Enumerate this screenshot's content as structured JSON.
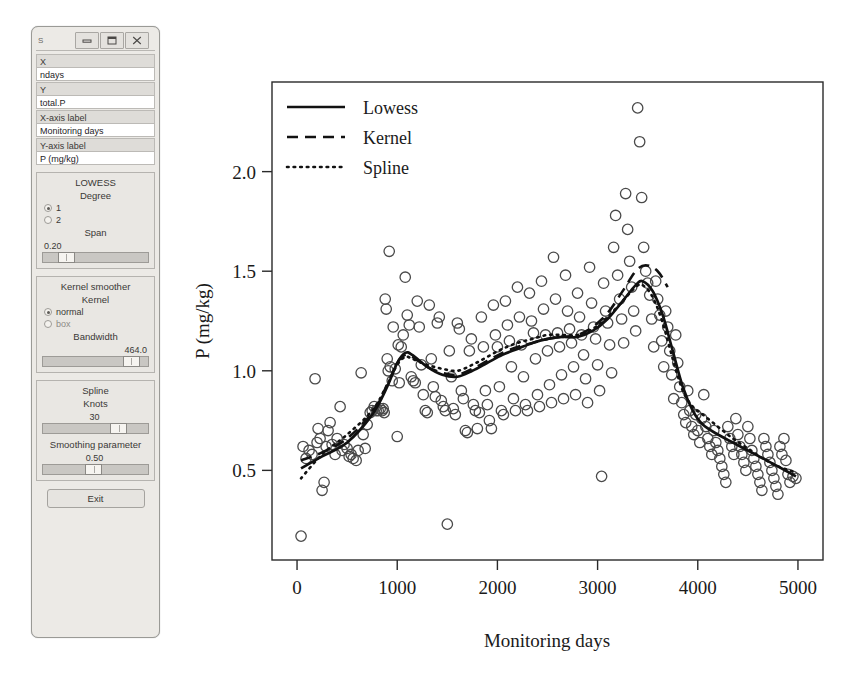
{
  "window": {
    "title": "S",
    "buttons": {
      "minimize": "minimize-icon",
      "maximize": "maximize-icon",
      "close": "close-icon"
    }
  },
  "form": {
    "fields": [
      {
        "label": "X",
        "value": "ndays"
      },
      {
        "label": "Y",
        "value": "total.P"
      },
      {
        "label": "X-axis label",
        "value": "Monitoring days"
      },
      {
        "label": "Y-axis label",
        "value": "P (mg/kg)"
      }
    ]
  },
  "lowess": {
    "title": "LOWESS",
    "degree_label": "Degree",
    "degree_options": [
      {
        "label": "1",
        "selected": true
      },
      {
        "label": "2",
        "selected": false
      }
    ],
    "span_label": "Span",
    "span_value": "0.20",
    "span_pct": 18
  },
  "kernel": {
    "title": "Kernel smoother",
    "kernel_label": "Kernel",
    "kernel_options": [
      {
        "label": "normal",
        "selected": true
      },
      {
        "label": "box",
        "selected": false
      }
    ],
    "bandwidth_label": "Bandwidth",
    "bandwidth_value": "464.0",
    "bandwidth_pct": 84
  },
  "spline": {
    "title": "Spline",
    "knots_label": "Knots",
    "knots_value": "30",
    "knots_pct": 72,
    "smoothing_label": "Smoothing parameter",
    "smoothing_value": "0.50",
    "smoothing_pct": 47
  },
  "exit_button": "Exit",
  "chart_data": {
    "type": "scatter",
    "title": "",
    "xlabel": "Monitoring days",
    "ylabel": "P (mg/kg)",
    "xlim": [
      -250,
      5250
    ],
    "ylim": [
      0.05,
      2.45
    ],
    "xticks": [
      0,
      1000,
      2000,
      3000,
      4000,
      5000
    ],
    "yticks": [
      0.5,
      1.0,
      1.5,
      2.0
    ],
    "grid": false,
    "legend_position": "top-left",
    "legend": [
      {
        "name": "Lowess",
        "style": "solid"
      },
      {
        "name": "Kernel",
        "style": "dashed"
      },
      {
        "name": "Spline",
        "style": "dotted"
      }
    ],
    "marker": "open-circle",
    "points": [
      [
        40,
        0.17
      ],
      [
        60,
        0.62
      ],
      [
        90,
        0.56
      ],
      [
        120,
        0.6
      ],
      [
        150,
        0.58
      ],
      [
        180,
        0.96
      ],
      [
        200,
        0.64
      ],
      [
        210,
        0.71
      ],
      [
        230,
        0.66
      ],
      [
        250,
        0.4
      ],
      [
        270,
        0.44
      ],
      [
        290,
        0.62
      ],
      [
        310,
        0.7
      ],
      [
        330,
        0.74
      ],
      [
        350,
        0.63
      ],
      [
        380,
        0.58
      ],
      [
        400,
        0.66
      ],
      [
        430,
        0.82
      ],
      [
        450,
        0.6
      ],
      [
        470,
        0.63
      ],
      [
        500,
        0.61
      ],
      [
        520,
        0.57
      ],
      [
        540,
        0.58
      ],
      [
        560,
        0.56
      ],
      [
        590,
        0.55
      ],
      [
        610,
        0.6
      ],
      [
        640,
        0.99
      ],
      [
        660,
        0.68
      ],
      [
        680,
        0.61
      ],
      [
        700,
        0.73
      ],
      [
        730,
        0.79
      ],
      [
        750,
        0.8
      ],
      [
        770,
        0.82
      ],
      [
        790,
        0.8
      ],
      [
        810,
        0.8
      ],
      [
        830,
        0.81
      ],
      [
        850,
        0.8
      ],
      [
        860,
        0.81
      ],
      [
        870,
        0.79
      ],
      [
        880,
        1.36
      ],
      [
        890,
        1.31
      ],
      [
        900,
        1.06
      ],
      [
        910,
        1.0
      ],
      [
        920,
        1.6
      ],
      [
        930,
        1.02
      ],
      [
        950,
        0.95
      ],
      [
        960,
        1.22
      ],
      [
        980,
        1.01
      ],
      [
        1000,
        0.67
      ],
      [
        1010,
        1.13
      ],
      [
        1020,
        0.94
      ],
      [
        1040,
        1.12
      ],
      [
        1060,
        1.18
      ],
      [
        1080,
        1.47
      ],
      [
        1100,
        1.28
      ],
      [
        1120,
        1.23
      ],
      [
        1140,
        0.97
      ],
      [
        1160,
        0.95
      ],
      [
        1180,
        0.94
      ],
      [
        1200,
        1.35
      ],
      [
        1220,
        1.22
      ],
      [
        1240,
        1.03
      ],
      [
        1260,
        0.88
      ],
      [
        1280,
        0.8
      ],
      [
        1300,
        0.79
      ],
      [
        1320,
        1.33
      ],
      [
        1340,
        1.06
      ],
      [
        1360,
        0.92
      ],
      [
        1380,
        0.87
      ],
      [
        1400,
        1.24
      ],
      [
        1420,
        1.27
      ],
      [
        1440,
        0.85
      ],
      [
        1460,
        0.82
      ],
      [
        1480,
        0.8
      ],
      [
        1500,
        0.23
      ],
      [
        1520,
        1.1
      ],
      [
        1540,
        0.97
      ],
      [
        1560,
        0.81
      ],
      [
        1580,
        0.78
      ],
      [
        1600,
        1.24
      ],
      [
        1620,
        1.21
      ],
      [
        1640,
        0.9
      ],
      [
        1660,
        0.86
      ],
      [
        1680,
        0.7
      ],
      [
        1700,
        0.69
      ],
      [
        1720,
        1.1
      ],
      [
        1740,
        1.16
      ],
      [
        1760,
        0.83
      ],
      [
        1780,
        0.8
      ],
      [
        1800,
        0.71
      ],
      [
        1820,
        0.79
      ],
      [
        1840,
        1.27
      ],
      [
        1860,
        1.12
      ],
      [
        1880,
        0.9
      ],
      [
        1900,
        0.83
      ],
      [
        1920,
        0.75
      ],
      [
        1940,
        0.71
      ],
      [
        1960,
        1.33
      ],
      [
        1980,
        1.18
      ],
      [
        2000,
        1.12
      ],
      [
        2020,
        0.92
      ],
      [
        2040,
        0.8
      ],
      [
        2060,
        0.78
      ],
      [
        2080,
        1.35
      ],
      [
        2100,
        1.23
      ],
      [
        2120,
        1.15
      ],
      [
        2140,
        1.02
      ],
      [
        2160,
        0.86
      ],
      [
        2180,
        0.8
      ],
      [
        2200,
        1.42
      ],
      [
        2220,
        1.27
      ],
      [
        2240,
        1.13
      ],
      [
        2260,
        0.97
      ],
      [
        2280,
        0.83
      ],
      [
        2300,
        0.8
      ],
      [
        2320,
        1.39
      ],
      [
        2340,
        1.25
      ],
      [
        2360,
        1.19
      ],
      [
        2380,
        1.06
      ],
      [
        2400,
        0.88
      ],
      [
        2420,
        0.82
      ],
      [
        2440,
        1.45
      ],
      [
        2460,
        1.31
      ],
      [
        2480,
        1.18
      ],
      [
        2500,
        1.1
      ],
      [
        2520,
        0.93
      ],
      [
        2540,
        0.84
      ],
      [
        2560,
        1.57
      ],
      [
        2580,
        1.36
      ],
      [
        2600,
        1.19
      ],
      [
        2620,
        1.12
      ],
      [
        2640,
        0.98
      ],
      [
        2660,
        0.86
      ],
      [
        2680,
        1.48
      ],
      [
        2700,
        1.3
      ],
      [
        2720,
        1.21
      ],
      [
        2740,
        1.14
      ],
      [
        2760,
        1.02
      ],
      [
        2780,
        0.88
      ],
      [
        2800,
        1.39
      ],
      [
        2820,
        1.27
      ],
      [
        2840,
        1.18
      ],
      [
        2860,
        1.08
      ],
      [
        2880,
        0.96
      ],
      [
        2900,
        0.84
      ],
      [
        2920,
        1.52
      ],
      [
        2940,
        1.34
      ],
      [
        2960,
        1.22
      ],
      [
        2980,
        1.16
      ],
      [
        3000,
        1.03
      ],
      [
        3020,
        0.9
      ],
      [
        3040,
        0.47
      ],
      [
        3060,
        1.44
      ],
      [
        3080,
        1.3
      ],
      [
        3100,
        1.24
      ],
      [
        3120,
        1.13
      ],
      [
        3140,
        0.99
      ],
      [
        3160,
        1.62
      ],
      [
        3180,
        1.78
      ],
      [
        3200,
        1.48
      ],
      [
        3220,
        1.36
      ],
      [
        3240,
        1.26
      ],
      [
        3260,
        1.14
      ],
      [
        3280,
        1.89
      ],
      [
        3300,
        1.71
      ],
      [
        3320,
        1.55
      ],
      [
        3340,
        1.42
      ],
      [
        3360,
        1.3
      ],
      [
        3380,
        1.2
      ],
      [
        3400,
        2.32
      ],
      [
        3420,
        2.15
      ],
      [
        3440,
        1.87
      ],
      [
        3460,
        1.62
      ],
      [
        3480,
        1.5
      ],
      [
        3500,
        1.44
      ],
      [
        3520,
        1.38
      ],
      [
        3540,
        1.26
      ],
      [
        3560,
        1.12
      ],
      [
        3580,
        1.45
      ],
      [
        3600,
        1.36
      ],
      [
        3620,
        1.28
      ],
      [
        3640,
        1.15
      ],
      [
        3660,
        1.02
      ],
      [
        3680,
        1.3
      ],
      [
        3700,
        1.22
      ],
      [
        3720,
        1.1
      ],
      [
        3740,
        0.98
      ],
      [
        3760,
        0.86
      ],
      [
        3780,
        1.18
      ],
      [
        3800,
        1.04
      ],
      [
        3820,
        0.92
      ],
      [
        3840,
        0.84
      ],
      [
        3860,
        0.78
      ],
      [
        3880,
        0.74
      ],
      [
        3900,
        0.9
      ],
      [
        3920,
        0.8
      ],
      [
        3940,
        0.72
      ],
      [
        3960,
        0.68
      ],
      [
        3980,
        0.78
      ],
      [
        4000,
        0.7
      ],
      [
        4020,
        0.64
      ],
      [
        4040,
        0.76
      ],
      [
        4060,
        0.88
      ],
      [
        4080,
        0.72
      ],
      [
        4100,
        0.66
      ],
      [
        4120,
        0.62
      ],
      [
        4140,
        0.58
      ],
      [
        4160,
        0.7
      ],
      [
        4180,
        0.64
      ],
      [
        4200,
        0.6
      ],
      [
        4220,
        0.56
      ],
      [
        4240,
        0.52
      ],
      [
        4260,
        0.48
      ],
      [
        4280,
        0.44
      ],
      [
        4300,
        0.72
      ],
      [
        4320,
        0.66
      ],
      [
        4340,
        0.62
      ],
      [
        4360,
        0.58
      ],
      [
        4380,
        0.76
      ],
      [
        4400,
        0.68
      ],
      [
        4420,
        0.62
      ],
      [
        4440,
        0.58
      ],
      [
        4460,
        0.54
      ],
      [
        4480,
        0.5
      ],
      [
        4500,
        0.72
      ],
      [
        4520,
        0.66
      ],
      [
        4540,
        0.6
      ],
      [
        4560,
        0.56
      ],
      [
        4580,
        0.52
      ],
      [
        4600,
        0.48
      ],
      [
        4620,
        0.44
      ],
      [
        4640,
        0.4
      ],
      [
        4660,
        0.66
      ],
      [
        4680,
        0.62
      ],
      [
        4700,
        0.58
      ],
      [
        4720,
        0.54
      ],
      [
        4740,
        0.5
      ],
      [
        4760,
        0.46
      ],
      [
        4780,
        0.42
      ],
      [
        4800,
        0.38
      ],
      [
        4820,
        0.62
      ],
      [
        4840,
        0.58
      ],
      [
        4860,
        0.66
      ],
      [
        4880,
        0.55
      ],
      [
        4900,
        0.48
      ],
      [
        4920,
        0.44
      ],
      [
        4950,
        0.47
      ],
      [
        4980,
        0.46
      ]
    ],
    "series": [
      {
        "name": "Lowess",
        "style": "solid",
        "points": [
          [
            40,
            0.51
          ],
          [
            250,
            0.57
          ],
          [
            500,
            0.64
          ],
          [
            750,
            0.78
          ],
          [
            900,
            0.92
          ],
          [
            1000,
            1.04
          ],
          [
            1080,
            1.09
          ],
          [
            1150,
            1.08
          ],
          [
            1300,
            1.02
          ],
          [
            1450,
            0.98
          ],
          [
            1600,
            0.97
          ],
          [
            1750,
            1.0
          ],
          [
            1900,
            1.04
          ],
          [
            2050,
            1.08
          ],
          [
            2200,
            1.11
          ],
          [
            2350,
            1.14
          ],
          [
            2500,
            1.16
          ],
          [
            2650,
            1.17
          ],
          [
            2800,
            1.17
          ],
          [
            2950,
            1.2
          ],
          [
            3100,
            1.26
          ],
          [
            3250,
            1.35
          ],
          [
            3380,
            1.43
          ],
          [
            3450,
            1.45
          ],
          [
            3550,
            1.4
          ],
          [
            3650,
            1.28
          ],
          [
            3750,
            1.1
          ],
          [
            3850,
            0.92
          ],
          [
            3950,
            0.8
          ],
          [
            4050,
            0.73
          ],
          [
            4200,
            0.68
          ],
          [
            4350,
            0.64
          ],
          [
            4500,
            0.6
          ],
          [
            4650,
            0.56
          ],
          [
            4800,
            0.52
          ],
          [
            4980,
            0.47
          ]
        ]
      },
      {
        "name": "Kernel",
        "style": "dashed",
        "points": [
          [
            40,
            0.55
          ],
          [
            250,
            0.59
          ],
          [
            500,
            0.66
          ],
          [
            750,
            0.79
          ],
          [
            900,
            0.93
          ],
          [
            1000,
            1.04
          ],
          [
            1080,
            1.08
          ],
          [
            1150,
            1.07
          ],
          [
            1300,
            1.02
          ],
          [
            1450,
            0.99
          ],
          [
            1600,
            0.98
          ],
          [
            1750,
            1.01
          ],
          [
            1900,
            1.05
          ],
          [
            2050,
            1.09
          ],
          [
            2200,
            1.12
          ],
          [
            2350,
            1.14
          ],
          [
            2500,
            1.16
          ],
          [
            2650,
            1.17
          ],
          [
            2800,
            1.18
          ],
          [
            2950,
            1.22
          ],
          [
            3100,
            1.29
          ],
          [
            3250,
            1.4
          ],
          [
            3380,
            1.5
          ],
          [
            3480,
            1.53
          ],
          [
            3600,
            1.5
          ],
          [
            3700,
            1.42
          ]
        ]
      },
      {
        "name": "Spline",
        "style": "dotted",
        "points": [
          [
            40,
            0.46
          ],
          [
            250,
            0.58
          ],
          [
            500,
            0.68
          ],
          [
            750,
            0.8
          ],
          [
            900,
            0.93
          ],
          [
            1000,
            1.03
          ],
          [
            1080,
            1.07
          ],
          [
            1150,
            1.06
          ],
          [
            1300,
            1.03
          ],
          [
            1450,
            1.01
          ],
          [
            1600,
            1.0
          ],
          [
            1750,
            1.03
          ],
          [
            1900,
            1.07
          ],
          [
            2050,
            1.11
          ],
          [
            2200,
            1.14
          ],
          [
            2350,
            1.16
          ],
          [
            2500,
            1.18
          ],
          [
            2650,
            1.18
          ],
          [
            2800,
            1.18
          ],
          [
            2950,
            1.21
          ],
          [
            3100,
            1.27
          ],
          [
            3250,
            1.35
          ],
          [
            3380,
            1.42
          ],
          [
            3450,
            1.43
          ],
          [
            3550,
            1.37
          ],
          [
            3650,
            1.24
          ],
          [
            3750,
            1.06
          ],
          [
            3850,
            0.9
          ],
          [
            3950,
            0.82
          ],
          [
            4050,
            0.78
          ],
          [
            4200,
            0.72
          ],
          [
            4350,
            0.66
          ],
          [
            4500,
            0.61
          ],
          [
            4650,
            0.56
          ],
          [
            4800,
            0.52
          ],
          [
            4980,
            0.49
          ]
        ]
      }
    ]
  }
}
